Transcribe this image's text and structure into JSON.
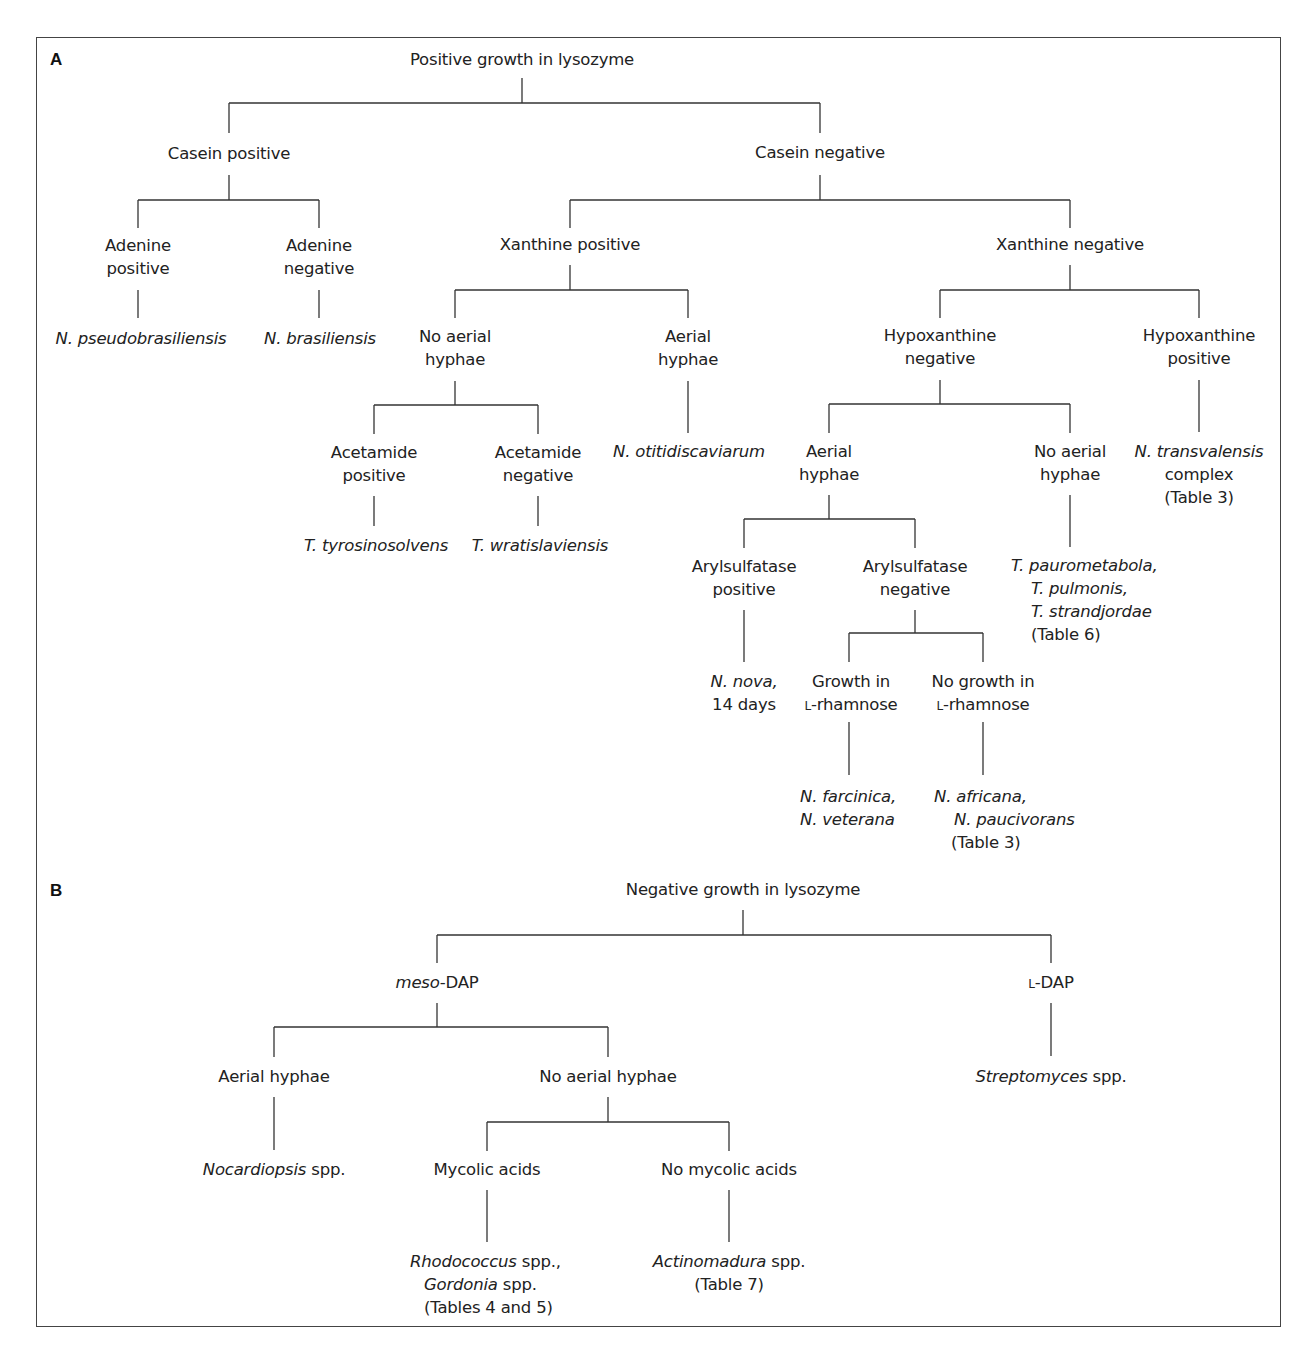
{
  "panels": {
    "a": {
      "label": "A",
      "root": "Positive growth in lysozyme",
      "casein_pos": "Casein positive",
      "casein_neg": "Casein negative",
      "adenine_pos": [
        "Adenine",
        "positive"
      ],
      "adenine_neg": [
        "Adenine",
        "negative"
      ],
      "n_pseudobrasiliensis": "N. pseudobrasiliensis",
      "n_brasiliensis": "N. brasiliensis",
      "xanthine_pos": "Xanthine positive",
      "xanthine_neg": "Xanthine negative",
      "xp_no_aerial": [
        "No aerial",
        "hyphae"
      ],
      "xp_aerial": [
        "Aerial",
        "hyphae"
      ],
      "acetamide_pos": [
        "Acetamide",
        "positive"
      ],
      "acetamide_neg": [
        "Acetamide",
        "negative"
      ],
      "t_tyrosinosolvens": "T. tyrosinosolvens",
      "t_wratislaviensis": "T. wratislaviensis",
      "n_otitidiscaviarum": "N. otitidiscaviarum",
      "hypox_neg": [
        "Hypoxanthine",
        "negative"
      ],
      "hypox_pos": [
        "Hypoxanthine",
        "positive"
      ],
      "hn_aerial": [
        "Aerial",
        "hyphae"
      ],
      "hn_no_aerial": [
        "No aerial",
        "hyphae"
      ],
      "aryl_pos": [
        "Arylsulfatase",
        "positive"
      ],
      "aryl_neg": [
        "Arylsulfatase",
        "negative"
      ],
      "n_nova": {
        "name": "N. nova,",
        "note": "14 days"
      },
      "growth_rham": {
        "l1": "Growth in",
        "prefix": "L",
        "rest": "-rhamnose"
      },
      "nogrowth_rham": {
        "l1": "No growth in",
        "prefix": "L",
        "rest": "-rhamnose"
      },
      "farcinica": {
        "l1": "N. farcinica,",
        "l2": "N. veterana"
      },
      "africana": {
        "l1": "N. africana,",
        "l2": "N. paucivorans",
        "l3": "(Table 3)"
      },
      "tsukamurella": {
        "l1": "T. paurometabola,",
        "l2": "T. pulmonis,",
        "l3": "T. strandjordae",
        "l4": "(Table 6)"
      },
      "transvalensis": {
        "l1": "N. transvalensis",
        "l2": "complex",
        "l3": "(Table 3)"
      }
    },
    "b": {
      "label": "B",
      "root": "Negative growth in lysozyme",
      "meso": {
        "it": "meso",
        "rest": "-DAP"
      },
      "ldap": {
        "prefix": "L",
        "rest": "-DAP"
      },
      "aerial": "Aerial hyphae",
      "no_aerial": "No aerial hyphae",
      "nocardiopsis": {
        "it": "Nocardiopsis",
        "rest": " spp."
      },
      "streptomyces": {
        "it": "Streptomyces",
        "rest": " spp."
      },
      "mycolic": "Mycolic acids",
      "no_mycolic": "No mycolic acids",
      "rhodococcus": {
        "it1": "Rhodococcus",
        "r1": " spp.,",
        "it2": "Gordonia",
        "r2": " spp.",
        "l3": "(Tables 4 and 5)"
      },
      "actinomadura": {
        "it": "Actinomadura",
        "rest": " spp.",
        "l2": "(Table 7)"
      }
    }
  },
  "style": {
    "line_color": "#333333",
    "text_color": "#222222",
    "border_color": "#444444"
  }
}
